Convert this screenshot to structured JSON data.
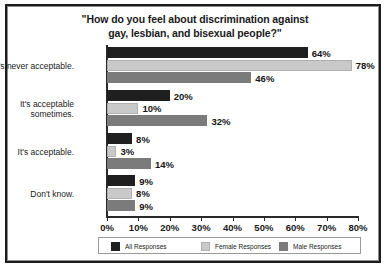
{
  "chart_data": {
    "type": "bar",
    "orientation": "horizontal",
    "title": "\"How do you feel about discrimination against gay, lesbian, and bisexual people?\"",
    "title_lines": [
      "\"How do you feel about discrimination against",
      "gay, lesbian, and bisexual people?\""
    ],
    "xlabel": "",
    "ylabel": "",
    "xlim": [
      0,
      80
    ],
    "grid": false,
    "legend_position": "bottom",
    "categories": [
      "It's never acceptable.",
      "It's acceptable sometimes.",
      "It's acceptable.",
      "Don't know."
    ],
    "category_label_lines": [
      [
        "It's never acceptable."
      ],
      [
        "It's acceptable",
        "sometimes."
      ],
      [
        "It's acceptable."
      ],
      [
        "Don't know."
      ]
    ],
    "series": [
      {
        "name": "All Responses",
        "color": "#1f1f1f",
        "values": [
          64,
          20,
          8,
          9
        ],
        "value_labels": [
          "64%",
          "20%",
          "8%",
          "9%"
        ]
      },
      {
        "name": "Female Responses",
        "color": "#c9c9c9",
        "values": [
          78,
          10,
          3,
          8
        ],
        "value_labels": [
          "78%",
          "10%",
          "3%",
          "8%"
        ]
      },
      {
        "name": "Male Responses",
        "color": "#7b7b7b",
        "values": [
          46,
          32,
          14,
          9
        ],
        "value_labels": [
          "46%",
          "32%",
          "14%",
          "9%"
        ]
      }
    ],
    "xticks": [
      0,
      10,
      20,
      30,
      40,
      50,
      60,
      70,
      80
    ],
    "xtick_labels": [
      "0%",
      "10%",
      "20%",
      "30%",
      "40%",
      "50%",
      "60%",
      "70%",
      "80%"
    ]
  },
  "legend": {
    "items": [
      {
        "label": "All Responses"
      },
      {
        "label": "Female Responses"
      },
      {
        "label": "Male Responses"
      }
    ]
  }
}
